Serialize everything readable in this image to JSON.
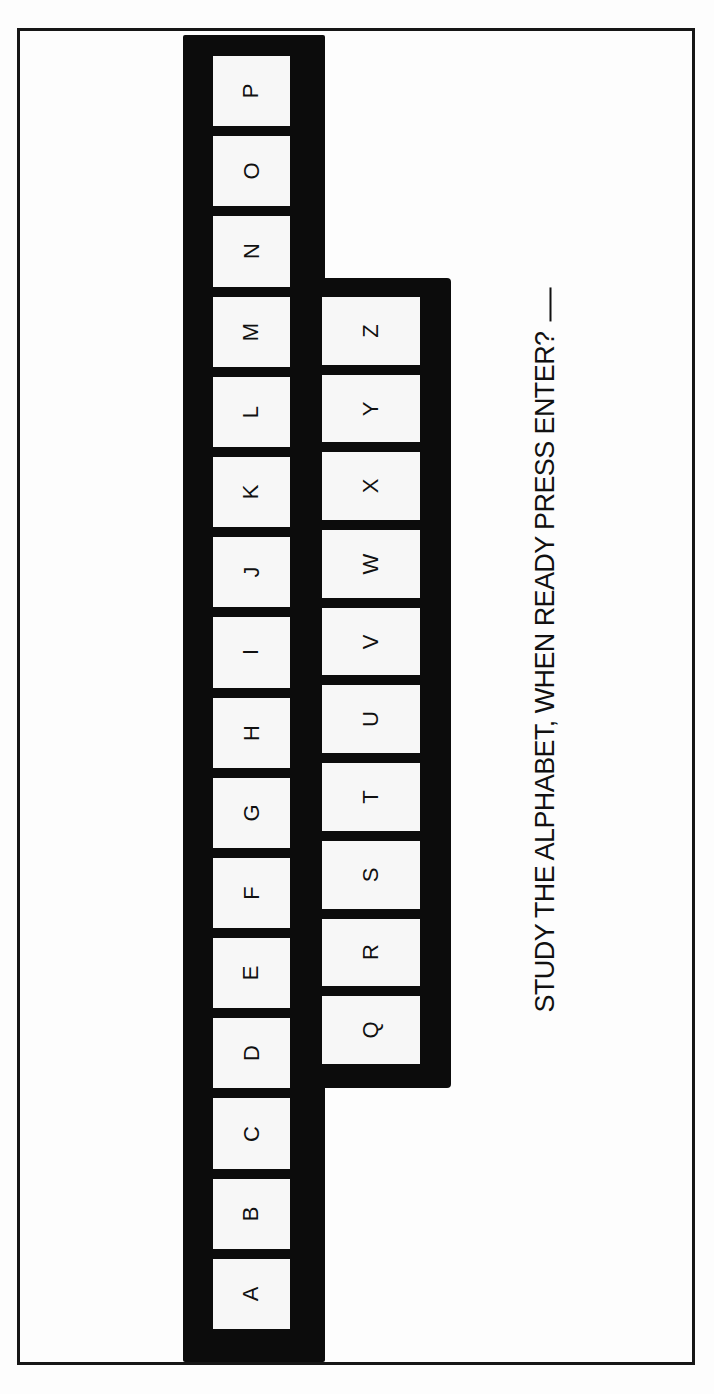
{
  "keyboard": {
    "top_row": [
      "P",
      "O",
      "N",
      "M",
      "L",
      "K",
      "J",
      "I",
      "H",
      "G",
      "F",
      "E",
      "D",
      "C",
      "B",
      "A"
    ],
    "bottom_row": [
      "Z",
      "Y",
      "X",
      "W",
      "V",
      "U",
      "T",
      "S",
      "R",
      "Q"
    ]
  },
  "prompt": {
    "text": "STUDY THE ALPHABET, WHEN READY PRESS ENTER?",
    "cursor": "_"
  },
  "colors": {
    "key_frame": "#0c0c0c",
    "key_face": "#f7f7f7",
    "text": "#111111",
    "background": "#fdfdfd"
  }
}
